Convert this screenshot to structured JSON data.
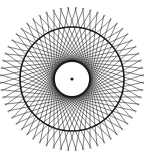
{
  "figure": {
    "type": "tangent-chord-rosette",
    "background": "#ffffff",
    "stroke_color": "#1a1a1a",
    "center": [
      72,
      79
    ],
    "inner_circle_radius": 18,
    "inner_circle_stroke_width": 1.8,
    "middle_circle_radius": 52,
    "middle_circle_stroke_width": 1.6,
    "outer_radius": 72,
    "chord_count": 60,
    "chord_stroke_width": 0.55,
    "center_dot_radius": 1.6
  }
}
